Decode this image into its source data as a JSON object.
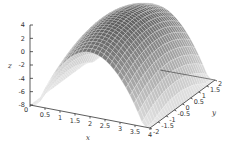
{
  "chart_data": {
    "type": "surface3d",
    "title": "",
    "xlabel": "x",
    "ylabel": "y",
    "zlabel": "z",
    "xlim": [
      0,
      4
    ],
    "ylim": [
      -2,
      2
    ],
    "zlim": [
      -8,
      4
    ],
    "x_ticks": [
      "0",
      "0.5",
      "1",
      "1.5",
      "2",
      "2.5",
      "3",
      "3.5",
      "4"
    ],
    "y_ticks": [
      "-2",
      "-1.5",
      "-1",
      "-0.5",
      "0",
      "0.5",
      "1",
      "1.5",
      "2"
    ],
    "z_ticks": [
      "-8",
      "-6",
      "-4",
      "-2",
      "0",
      "2",
      "4"
    ],
    "surface": {
      "description": "Dome-shaped surface, maximum about 4 at center (x=2, y=0), falling to about -8 at the x edges",
      "peak": {
        "x": 2,
        "y": 0,
        "z": 4
      },
      "grid_resolution": 30,
      "shading": "grayscale",
      "colors": {
        "high": "#5a5a5a",
        "low": "#e6e6e6",
        "mesh": "#ffffff"
      }
    },
    "grid": false,
    "legend": null
  }
}
